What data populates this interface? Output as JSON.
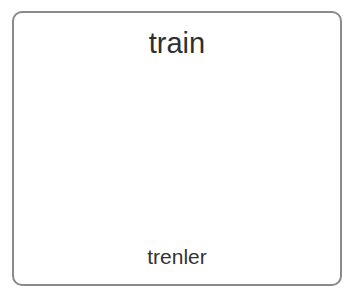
{
  "card": {
    "title": "train",
    "caption": "trenler",
    "icon": "train-locomotive-icon"
  },
  "colors": {
    "border": "#8a8a8a",
    "outline": "#3a3a3a",
    "smoke": "#666666",
    "wheels": "#666666",
    "roof": "#9a9a9a",
    "base": "#a3a3a3",
    "body": "#d6d6d6",
    "light": "#eeeeee",
    "text": "#2f2f2f"
  }
}
